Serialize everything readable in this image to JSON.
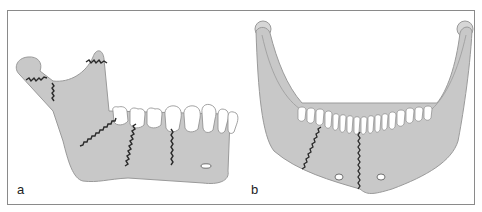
{
  "figure": {
    "panels": [
      {
        "label": "a",
        "view": "lateral",
        "subject": "mandible-with-fracture-lines"
      },
      {
        "label": "b",
        "view": "frontal",
        "subject": "mandible-with-fracture-lines"
      }
    ]
  },
  "colors": {
    "bone": "#c8c8c8",
    "bone_outline": "#9a9a9a",
    "teeth": "#ffffff",
    "fracture_line": "#2a2a2a",
    "frame": "#8a8a8a",
    "background": "#ffffff"
  }
}
